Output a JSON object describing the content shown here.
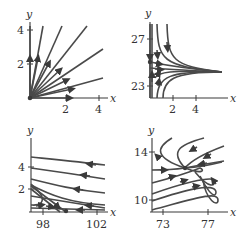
{
  "panels": [
    {
      "id": "top-left",
      "x_label": "x",
      "y_label": "y",
      "x_ticks": [
        "2",
        "4"
      ],
      "y_ticks": [
        "4",
        "2"
      ],
      "description": "unstable node: trajectories radiate outward from origin"
    },
    {
      "id": "top-right",
      "x_label": "x",
      "y_label": "y",
      "x_ticks": [
        "2",
        "4"
      ],
      "y_ticks": [
        "27",
        "23"
      ],
      "description": "trajectories converge to horizontal asymptote near y=25"
    },
    {
      "id": "bottom-left",
      "x_label": "x",
      "y_label": "y",
      "x_ticks": [
        "98",
        "102"
      ],
      "y_ticks": [
        "4",
        "2"
      ],
      "description": "trajectories flow leftward, decaying toward x-axis"
    },
    {
      "id": "bottom-right",
      "x_label": "x",
      "y_label": "y",
      "x_ticks": [
        "73",
        "77"
      ],
      "y_ticks": [
        "14",
        "10"
      ],
      "description": "parabolic trajectories turning around, crossing near (75,12.5)"
    }
  ],
  "colors": {
    "ink": "#3a3a3a",
    "background": "#ffffff"
  }
}
